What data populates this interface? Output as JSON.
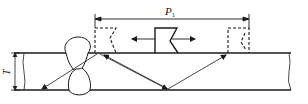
{
  "diagram": {
    "type": "ultrasonic-weld-inspection",
    "labels": {
      "thickness": "T",
      "scan_distance": "P",
      "scan_distance_subscript": "1"
    },
    "colors": {
      "line": "#1a1a1a",
      "background": "#ffffff"
    },
    "elements": [
      "plate",
      "weld-bead",
      "probe-center",
      "probe-left-dashed",
      "probe-right-dashed",
      "sound-path-left",
      "sound-path-right",
      "dimension-p1",
      "dimension-t",
      "bidirectional-arrow"
    ]
  }
}
